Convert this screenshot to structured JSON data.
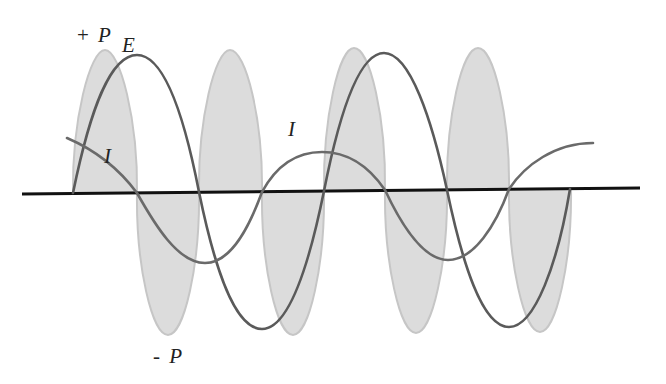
{
  "diagram": {
    "labels": {
      "positive_power": {
        "sign": "+",
        "symbol": "P"
      },
      "negative_power": {
        "sign": "-",
        "symbol": "P"
      },
      "voltage": "E",
      "current_1": "I",
      "current_2": "I"
    },
    "colors": {
      "power_lobe_fill": "#dcdcdc",
      "power_lobe_stroke": "#c6c6c6",
      "curve": "#5a5a5a",
      "axis": "#111111",
      "background": "#ffffff"
    },
    "power_lobes": [
      {
        "polarity": "positive",
        "x_start": 73,
        "x_end": 137,
        "extreme_y": 50
      },
      {
        "polarity": "negative",
        "x_start": 137,
        "x_end": 199,
        "extreme_y": 335
      },
      {
        "polarity": "positive",
        "x_start": 199,
        "x_end": 262,
        "extreme_y": 50
      },
      {
        "polarity": "negative",
        "x_start": 262,
        "x_end": 324,
        "extreme_y": 335
      },
      {
        "polarity": "positive",
        "x_start": 324,
        "x_end": 385,
        "extreme_y": 48
      },
      {
        "polarity": "negative",
        "x_start": 385,
        "x_end": 447,
        "extreme_y": 333
      },
      {
        "polarity": "positive",
        "x_start": 447,
        "x_end": 509,
        "extreme_y": 48
      },
      {
        "polarity": "negative",
        "x_start": 509,
        "x_end": 571,
        "extreme_y": 332
      }
    ]
  }
}
